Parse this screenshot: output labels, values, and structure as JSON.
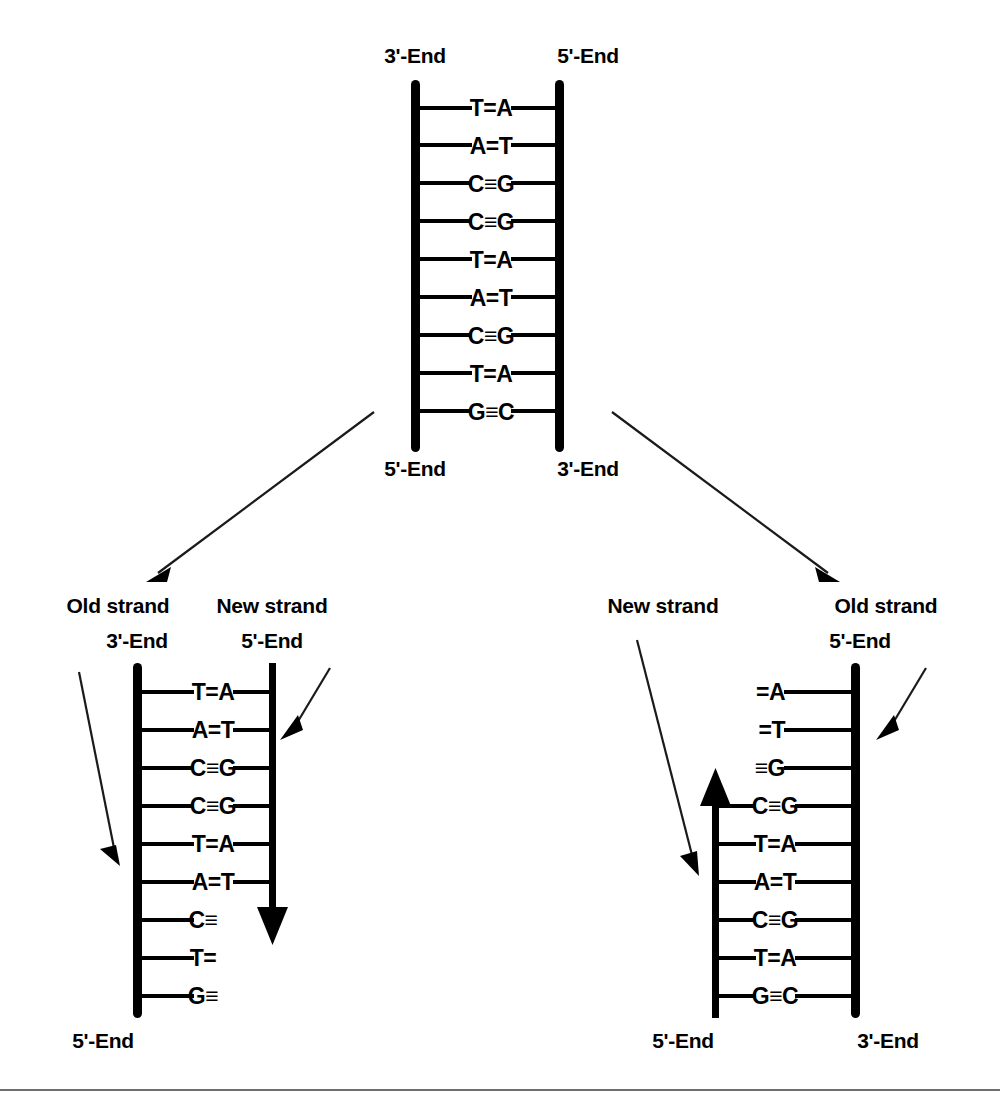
{
  "figure": {
    "type": "dna-replication-diagram",
    "background_color": "#ffffff",
    "ink_color": "#000000",
    "footer_rule_color": "#6e6e6e",
    "parent": {
      "name": "parent-dna-molecule",
      "top_left_label": "3'-End",
      "top_right_label": "5'-End",
      "bottom_left_label": "5'-End",
      "bottom_right_label": "3'-End",
      "base_pairs": [
        "T=A",
        "A=T",
        "C≡G",
        "C≡G",
        "T=A",
        "A=T",
        "C≡G",
        "T=A",
        "G≡C"
      ]
    },
    "daughter_left": {
      "name": "daughter-molecule-left",
      "left_strand_label": "Old strand",
      "right_strand_label": "New strand",
      "top_left_label": "3'-End",
      "top_right_label": "5'-End",
      "bottom_left_label": "5'-End",
      "base_pairs": [
        "T=A",
        "A=T",
        "C≡G",
        "C≡G",
        "T=A",
        "A=T",
        "C≡",
        "T=",
        "G≡"
      ],
      "complete_pair_count": 6,
      "new_strand_direction": "downward"
    },
    "daughter_right": {
      "name": "daughter-molecule-right",
      "left_strand_label": "New strand",
      "right_strand_label": "Old strand",
      "top_right_label": "5'-End",
      "bottom_left_label": "5'-End",
      "bottom_right_label": "3'-End",
      "base_pairs": [
        "=A",
        "=T",
        "≡G",
        "C≡G",
        "T=A",
        "A=T",
        "C≡G",
        "T=A",
        "G≡C"
      ],
      "incomplete_pair_count": 3,
      "new_strand_direction": "upward"
    }
  }
}
